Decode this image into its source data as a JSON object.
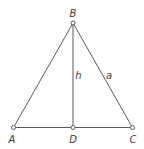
{
  "diagram": {
    "type": "geometry",
    "vertices": [
      {
        "id": "A",
        "label": "A",
        "x": 13.5,
        "y": 127.5,
        "label_x": 12,
        "label_y": 141
      },
      {
        "id": "B",
        "label": "B",
        "x": 73,
        "y": 23,
        "label_x": 73,
        "label_y": 14
      },
      {
        "id": "C",
        "label": "C",
        "x": 132.5,
        "y": 127.5,
        "label_x": 133,
        "label_y": 141
      },
      {
        "id": "D",
        "label": "D",
        "x": 73,
        "y": 127.5,
        "label_x": 73,
        "label_y": 141
      }
    ],
    "segments": [
      {
        "from": "A",
        "to": "B"
      },
      {
        "from": "B",
        "to": "C"
      },
      {
        "from": "A",
        "to": "C"
      },
      {
        "from": "B",
        "to": "D",
        "label": "h"
      }
    ],
    "segment_labels": {
      "altitude": {
        "text": "h",
        "x": 78,
        "y": 79
      },
      "side_bc": {
        "text": "a",
        "x": 108,
        "y": 79
      }
    },
    "colors": {
      "line": "#5a5a5a",
      "text": "#3a3a3a",
      "background": "#ffffff"
    }
  }
}
